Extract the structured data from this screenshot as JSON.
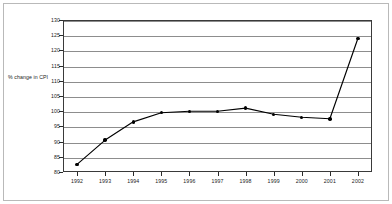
{
  "chart_data": {
    "type": "line",
    "title": "",
    "subtitle": "",
    "xlabel": "",
    "ylabel": "% change in CPI",
    "categories": [
      "1992",
      "1993",
      "1994",
      "1995",
      "1996",
      "1997",
      "1998",
      "1999",
      "2000",
      "2001",
      "2002"
    ],
    "x": [
      1992,
      1993,
      1994,
      1995,
      1996,
      1997,
      1998,
      1999,
      2000,
      2001,
      2002
    ],
    "values": [
      82.5,
      90.5,
      96.5,
      99.5,
      100,
      100,
      101,
      99,
      98,
      97.5,
      124
    ],
    "series": [
      {
        "name": "% change in CPI",
        "values": [
          82.5,
          90.5,
          96.5,
          99.5,
          100,
          100,
          101,
          99,
          98,
          97.5,
          124
        ]
      }
    ],
    "ylim": [
      80,
      130
    ],
    "yticks": [
      80,
      85,
      90,
      95,
      100,
      105,
      110,
      115,
      120,
      125,
      130
    ],
    "ytick_labels": [
      "80",
      "85",
      "90",
      "95",
      "100",
      "105",
      "110",
      "115",
      "120",
      "125",
      "130"
    ],
    "xlim": [
      1991.5,
      2002.5
    ],
    "grid": true,
    "grid_axis": "y",
    "legend": false,
    "legend_position": "none",
    "marker": "filled-circle",
    "line_color": "#000000",
    "grid_color": "#8d8d8d",
    "frame_color": "#3a3a3a",
    "background_color": "#ffffff",
    "annotations": []
  }
}
